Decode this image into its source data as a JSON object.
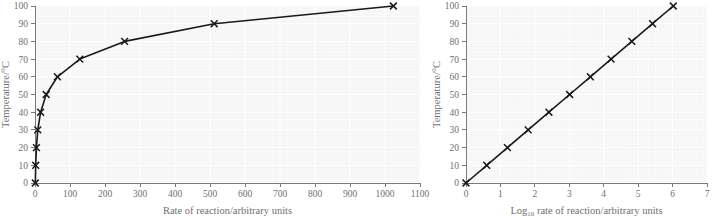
{
  "figure": {
    "background_color": "#ffffff",
    "plot_background_color": "#f6f6f6",
    "line_color": "#1a1a1a",
    "axis_color": "#7a7a7a",
    "text_color": "#6f6f6f"
  },
  "chart_data": [
    {
      "type": "line",
      "panel": "left",
      "title": "",
      "xlabel": "Rate of reaction/arbitrary units",
      "ylabel": "Temperature/°C",
      "xlim": [
        0,
        1100
      ],
      "ylim": [
        0,
        100
      ],
      "xticks": [
        0,
        100,
        200,
        300,
        400,
        500,
        600,
        700,
        800,
        900,
        1000,
        1100
      ],
      "xticklabels": [
        "0",
        "100",
        "200",
        "300",
        "400",
        "500",
        "600",
        "700",
        "800",
        "900",
        "1000",
        "1100"
      ],
      "yticks": [
        0,
        10,
        20,
        30,
        40,
        50,
        60,
        70,
        80,
        90,
        100
      ],
      "yticklabels": [
        "0",
        "10",
        "20",
        "30",
        "40",
        "50",
        "60",
        "70",
        "80",
        "90",
        "100"
      ],
      "grid": true,
      "legend": "none",
      "marker": "x",
      "x": [
        1,
        2,
        4,
        8,
        16,
        32,
        64,
        128,
        256,
        512,
        1024
      ],
      "y": [
        0,
        10,
        20,
        30,
        40,
        50,
        60,
        70,
        80,
        90,
        100
      ]
    },
    {
      "type": "line",
      "panel": "right",
      "title": "",
      "xlabel_prefix": "Log",
      "xlabel_subscript": "10",
      "xlabel_suffix": " rate of reaction/arbitrary units",
      "xlabel": "Log10 rate of reaction/arbitrary units",
      "ylabel": "Temperature/°C",
      "xlim": [
        0,
        7
      ],
      "ylim": [
        0,
        100
      ],
      "xticks": [
        0,
        1,
        2,
        3,
        4,
        5,
        6,
        7
      ],
      "xticklabels": [
        "0",
        "1",
        "2",
        "3",
        "4",
        "5",
        "6",
        "7"
      ],
      "yticks": [
        0,
        10,
        20,
        30,
        40,
        50,
        60,
        70,
        80,
        90,
        100
      ],
      "yticklabels": [
        "0",
        "10",
        "20",
        "30",
        "40",
        "50",
        "60",
        "70",
        "80",
        "90",
        "100"
      ],
      "grid": true,
      "legend": "none",
      "marker": "x",
      "x": [
        0,
        0.301,
        0.602,
        0.903,
        1.204,
        1.505,
        1.806,
        2.107,
        2.408,
        2.709,
        3.01
      ],
      "x_displayed": [
        0,
        0.602,
        1.204,
        1.806,
        2.408,
        3.01,
        3.612,
        4.214,
        4.816,
        5.418,
        6.02
      ],
      "y": [
        0,
        10,
        20,
        30,
        40,
        50,
        60,
        70,
        80,
        90,
        100
      ]
    }
  ]
}
